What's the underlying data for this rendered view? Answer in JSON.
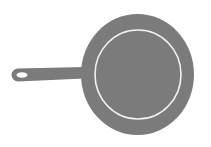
{
  "image": {
    "subject": "frying-pan-icon",
    "width": 211,
    "height": 147,
    "background_color": "#ffffff"
  },
  "pan": {
    "body_color": "#7b7b7b",
    "ring_color": "#f2f2f2",
    "outer": {
      "cx": 137.5,
      "cy": 74.5,
      "rx": 56.5,
      "ry": 60.5
    },
    "inner_ring": {
      "cx": 138,
      "cy": 74.5,
      "rx": 43,
      "ry": 44.5,
      "stroke_width": 1.6
    }
  },
  "handle": {
    "color": "#7b7b7b",
    "hole_color": "#ffffff"
  }
}
